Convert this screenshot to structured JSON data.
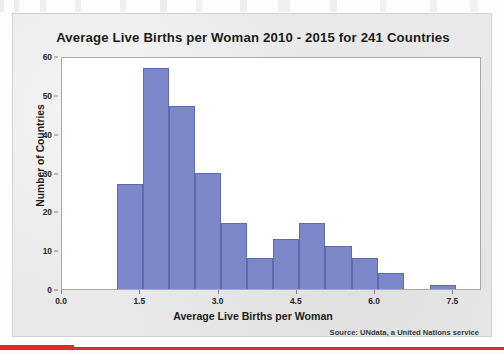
{
  "chart_data": {
    "type": "bar",
    "title": "Average Live Births per Woman 2010 - 2015 for 241 Countries",
    "xlabel": "Average Live Births per Woman",
    "ylabel": "Number of Countries",
    "source": "Source: UNdata, a United Nations service",
    "grid": false,
    "legend": null,
    "xlim": [
      0.0,
      8.05
    ],
    "ylim": [
      0,
      60
    ],
    "x_ticks": [
      "0.0",
      "1.5",
      "3.0",
      "4.5",
      "6.0",
      "7.5"
    ],
    "x_tick_values": [
      0.0,
      1.5,
      3.0,
      4.5,
      6.0,
      7.5
    ],
    "y_ticks": [
      "0",
      "10",
      "20",
      "30",
      "40",
      "50",
      "60"
    ],
    "y_tick_values": [
      0,
      10,
      20,
      30,
      40,
      50,
      60
    ],
    "bin_width": 0.5,
    "bin_edges": [
      1.05,
      1.55,
      2.05,
      2.55,
      3.05,
      3.55,
      4.05,
      4.55,
      5.05,
      5.55,
      6.05,
      6.55,
      7.05,
      7.55
    ],
    "categories": [
      "1.05-1.55",
      "1.55-2.05",
      "2.05-2.55",
      "2.55-3.05",
      "3.05-3.55",
      "3.55-4.05",
      "4.05-4.55",
      "4.55-5.05",
      "5.05-5.55",
      "5.55-6.05",
      "6.05-6.55",
      "6.55-7.05",
      "7.05-7.55"
    ],
    "values": [
      27,
      57,
      47,
      30,
      17,
      8,
      13,
      17,
      11,
      8,
      4,
      0,
      1
    ],
    "bar_color": "#7b87c8",
    "bar_edge_color": "#5d6aad"
  },
  "colors": {
    "accent": "#7b87c8",
    "panel_background": "#e9e9e9",
    "plot_background": "#ffffff",
    "rule": "#d93025",
    "text": "#1d1d20"
  }
}
